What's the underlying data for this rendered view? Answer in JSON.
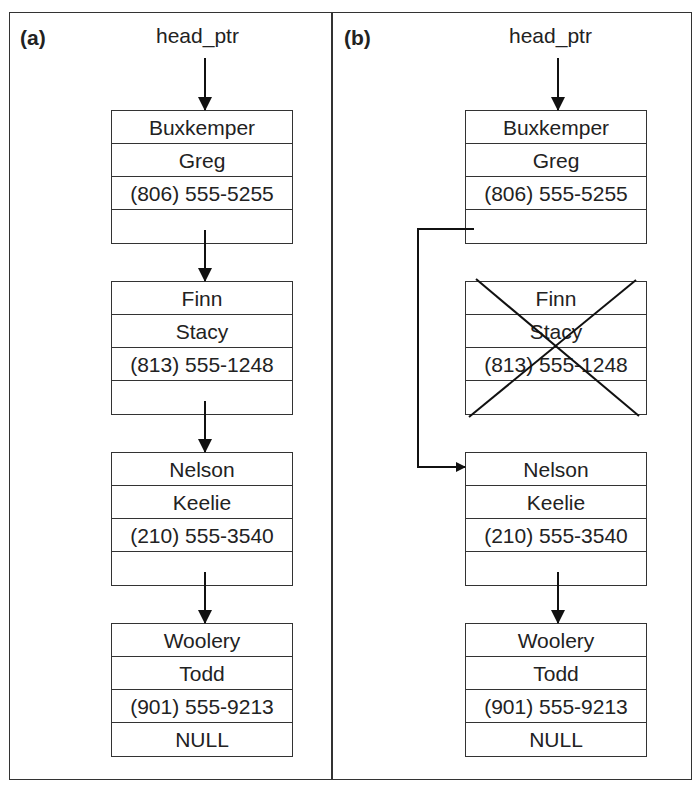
{
  "panels": [
    {
      "label": "(a)",
      "head": "head_ptr",
      "nodes": [
        {
          "last": "Buxkemper",
          "first": "Greg",
          "phone": "(806) 555-5255",
          "next": ""
        },
        {
          "last": "Finn",
          "first": "Stacy",
          "phone": "(813) 555-1248",
          "next": ""
        },
        {
          "last": "Nelson",
          "first": "Keelie",
          "phone": "(210) 555-3540",
          "next": ""
        },
        {
          "last": "Woolery",
          "first": "Todd",
          "phone": "(901) 555-9213",
          "next": "NULL"
        }
      ]
    },
    {
      "label": "(b)",
      "head": "head_ptr",
      "nodes": [
        {
          "last": "Buxkemper",
          "first": "Greg",
          "phone": "(806) 555-5255",
          "next": ""
        },
        {
          "last": "Finn",
          "first": "Stacy",
          "phone": "(813) 555-1248",
          "next": "",
          "deleted": true
        },
        {
          "last": "Nelson",
          "first": "Keelie",
          "phone": "(210) 555-3540",
          "next": ""
        },
        {
          "last": "Woolery",
          "first": "Todd",
          "phone": "(901) 555-9213",
          "next": "NULL"
        }
      ]
    }
  ]
}
